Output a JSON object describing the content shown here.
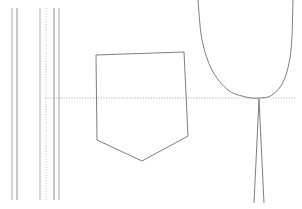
{
  "canvas": {
    "width": 302,
    "height": 209,
    "background": "#ffffff",
    "title": "technical-line-drawing"
  },
  "style": {
    "stroke_dark": "#777777",
    "stroke_mid": "#9a9a9a",
    "stroke_light": "#c2c2c2",
    "stroke_faint": "#d9d9d9",
    "dotted_axis_color": "#a8a8a8",
    "line_width_thin": 0.8,
    "line_width_normal": 1
  },
  "chart_data": {
    "type": "line",
    "title": "",
    "xlabel": "",
    "ylabel": "",
    "xlim": [
      0,
      302
    ],
    "ylim": [
      0,
      209
    ],
    "grid": false,
    "legend": null,
    "series": [
      {
        "name": "vertical-rule-1",
        "kind": "vertical-line",
        "x": 12,
        "y_start": 8,
        "y_end": 200,
        "dash": "solid",
        "color": "#b5b5b5"
      },
      {
        "name": "vertical-rule-2",
        "kind": "vertical-line",
        "x": 17,
        "y_start": 8,
        "y_end": 200,
        "dash": "solid",
        "color": "#9a9a9a"
      },
      {
        "name": "vertical-rule-3",
        "kind": "vertical-line",
        "x": 40,
        "y_start": 8,
        "y_end": 200,
        "dash": "solid",
        "color": "#b5b5b5"
      },
      {
        "name": "vertical-dotted-axis",
        "kind": "vertical-line",
        "x": 46,
        "y_start": 8,
        "y_end": 200,
        "dash": "dotted",
        "color": "#bdbdbd"
      },
      {
        "name": "vertical-rule-4",
        "kind": "vertical-line",
        "x": 54,
        "y_start": 8,
        "y_end": 200,
        "dash": "solid",
        "color": "#9a9a9a"
      },
      {
        "name": "vertical-rule-5",
        "kind": "vertical-line",
        "x": 59,
        "y_start": 8,
        "y_end": 200,
        "dash": "solid",
        "color": "#b0b0b0"
      },
      {
        "name": "horizontal-dotted-axis",
        "kind": "horizontal-line",
        "y": 98,
        "x_start": 45,
        "x_end": 296,
        "dash": "dotted",
        "color": "#a8a8a8"
      },
      {
        "name": "pentagon-outline",
        "kind": "polygon",
        "color": "#6f6f6f",
        "points": [
          [
            96,
            55
          ],
          [
            184,
            52
          ],
          [
            188,
            136
          ],
          [
            142,
            161
          ],
          [
            97,
            140
          ]
        ]
      },
      {
        "name": "parabola-bowl",
        "kind": "open-curve",
        "color": "#6f6f6f",
        "description": "U-shaped bowl, left branch enters top edge, right branch exits top edge",
        "points": [
          [
            198,
            0
          ],
          [
            202,
            40
          ],
          [
            212,
            70
          ],
          [
            228,
            90
          ],
          [
            246,
            97
          ],
          [
            259,
            98
          ],
          [
            272,
            95
          ],
          [
            284,
            80
          ],
          [
            291,
            50
          ],
          [
            293,
            0
          ]
        ]
      },
      {
        "name": "stem-left-edge",
        "kind": "line",
        "color": "#6f6f6f",
        "points": [
          [
            259,
            99
          ],
          [
            254,
            203
          ]
        ]
      },
      {
        "name": "stem-right-edge",
        "kind": "line",
        "color": "#6f6f6f",
        "points": [
          [
            259,
            99
          ],
          [
            264,
            203
          ]
        ]
      }
    ]
  }
}
